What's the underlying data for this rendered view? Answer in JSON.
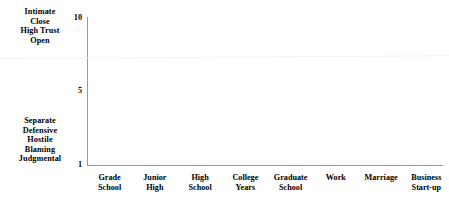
{
  "chart_data": {
    "type": "line",
    "title": "",
    "subtitle": "",
    "xlabel": "",
    "ylabel": "",
    "grid": false,
    "legend": false,
    "series": [],
    "categories": [
      "Grade School",
      "Junior High",
      "High School",
      "College Years",
      "Graduate School",
      "Work",
      "Marriage",
      "Business Start-up"
    ],
    "category_lines": [
      [
        "Grade",
        "School"
      ],
      [
        "Junior",
        "High"
      ],
      [
        "High",
        "School"
      ],
      [
        "College",
        "Years"
      ],
      [
        "Graduate",
        "School"
      ],
      [
        "Work"
      ],
      [
        "Marriage"
      ],
      [
        "Business",
        "Start-up"
      ]
    ],
    "ylim": [
      1,
      10
    ],
    "yticks": [
      1,
      5,
      10
    ],
    "ytick_labels": [
      "1",
      "5",
      "10"
    ],
    "y_axis_high_anchor": [
      "Intimate",
      "Close",
      "High Trust",
      "Open"
    ],
    "y_axis_low_anchor": [
      "Separate",
      "Defensive",
      "Hostile",
      "Blaming",
      "Judgmental"
    ]
  },
  "axis": {
    "color": "#9a9a9a"
  },
  "text_color": "#000000"
}
